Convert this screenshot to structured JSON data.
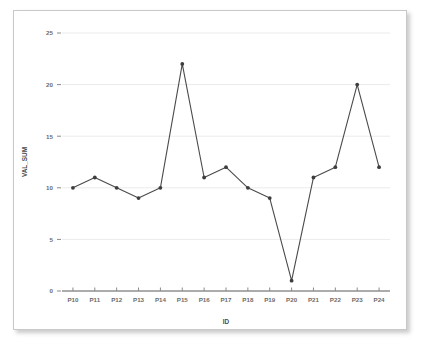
{
  "chart_data": {
    "type": "line",
    "title": "",
    "xlabel": "ID",
    "ylabel": "VAL_SUM",
    "categories": [
      "P10",
      "P11",
      "P12",
      "P13",
      "P14",
      "P15",
      "P16",
      "P17",
      "P18",
      "P19",
      "P20",
      "P21",
      "P22",
      "P23",
      "P24"
    ],
    "values": [
      10,
      11,
      10,
      9,
      10,
      22,
      11,
      12,
      10,
      9,
      1,
      11,
      12,
      20,
      12
    ],
    "series": [
      {
        "name": "VAL_SUM",
        "values": [
          10,
          11,
          10,
          9,
          10,
          22,
          11,
          12,
          10,
          9,
          1,
          11,
          12,
          20,
          12
        ]
      }
    ],
    "ylim": [
      0,
      25
    ],
    "y_ticks": [
      0,
      5,
      10,
      15,
      20,
      25
    ],
    "y_tick_labels": [
      "0",
      "5",
      "10",
      "15",
      "20",
      "25"
    ],
    "grid": true,
    "grid_axis": "y",
    "legend": false,
    "legend_position": "none",
    "marker": "circle",
    "line_color": "#4a4a4a",
    "marker_color": "#3d3d3d",
    "grid_color": "#ebebeb",
    "axis_color": "#595959",
    "background_color": "#ffffff",
    "border_color": "#c9c9c9"
  }
}
